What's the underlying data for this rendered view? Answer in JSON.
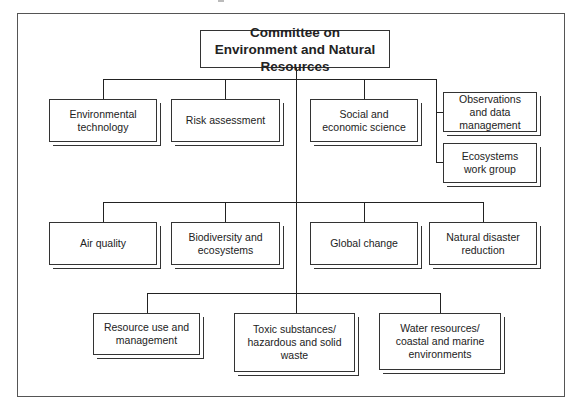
{
  "diagram": {
    "type": "org-chart",
    "root": "Committee on Environment and Natural Resources",
    "rows": [
      {
        "name": "row-1",
        "nodes": [
          {
            "id": "environmental-technology",
            "label": "Environmental technology"
          },
          {
            "id": "risk-assessment",
            "label": "Risk assessment"
          },
          {
            "id": "social-economic-science",
            "label": "Social and economic science"
          }
        ],
        "side_branch": [
          {
            "id": "observations-data-management",
            "label": "Observations and data management"
          },
          {
            "id": "ecosystems-work-group",
            "label": "Ecosystems work group"
          }
        ]
      },
      {
        "name": "row-2",
        "nodes": [
          {
            "id": "air-quality",
            "label": "Air quality"
          },
          {
            "id": "biodiversity-ecosystems",
            "label": "Biodiversity and ecosystems"
          },
          {
            "id": "global-change",
            "label": "Global change"
          },
          {
            "id": "natural-disaster-reduction",
            "label": "Natural disaster reduction"
          }
        ]
      },
      {
        "name": "row-3",
        "nodes": [
          {
            "id": "resource-use-management",
            "label": "Resource use and management"
          },
          {
            "id": "toxic-substances",
            "label": "Toxic substances/ hazardous and solid waste"
          },
          {
            "id": "water-resources",
            "label": "Water resources/ coastal and marine environments"
          }
        ]
      }
    ]
  }
}
